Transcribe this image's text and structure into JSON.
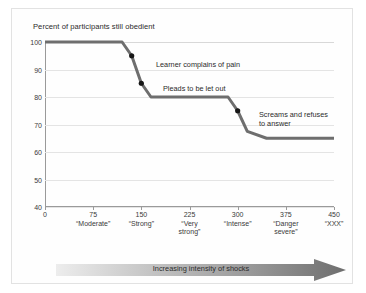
{
  "chart_data": {
    "type": "line",
    "title": "Percent of participants still obedient",
    "xlabel": "Increasing intensity of shocks",
    "ylabel": "Percent of participants still obedient",
    "xlim": [
      0,
      450
    ],
    "ylim": [
      40,
      100
    ],
    "grid": true,
    "legend": null,
    "y_ticks": [
      100,
      90,
      80,
      70,
      60,
      50,
      40
    ],
    "x_ticks": [
      {
        "value": 0,
        "volt": "0",
        "word": ""
      },
      {
        "value": 75,
        "volt": "75",
        "word": "“Moderate”"
      },
      {
        "value": 150,
        "volt": "150",
        "word": "“Strong”"
      },
      {
        "value": 225,
        "volt": "225",
        "word": "“Very\nstrong”"
      },
      {
        "value": 300,
        "volt": "300",
        "word": "“Intense”"
      },
      {
        "value": 375,
        "volt": "375",
        "word": "“Danger\nsevere”"
      },
      {
        "value": 450,
        "volt": "450",
        "word": "“XXX”"
      }
    ],
    "series": [
      {
        "name": "Percent still obedient",
        "color": "#6e6e6e",
        "points": [
          {
            "x": 0,
            "y": 100
          },
          {
            "x": 120,
            "y": 100
          },
          {
            "x": 135,
            "y": 95
          },
          {
            "x": 150,
            "y": 85
          },
          {
            "x": 165,
            "y": 80
          },
          {
            "x": 285,
            "y": 80
          },
          {
            "x": 300,
            "y": 75
          },
          {
            "x": 315,
            "y": 67.5
          },
          {
            "x": 345,
            "y": 65
          },
          {
            "x": 450,
            "y": 65
          }
        ]
      }
    ],
    "markers": [
      {
        "x": 135,
        "y": 95,
        "label": "Learner complains of pain"
      },
      {
        "x": 150,
        "y": 85,
        "label": "Pleads to be let out"
      },
      {
        "x": 300,
        "y": 75,
        "label": "Screams and refuses\nto answer"
      }
    ],
    "annotations": [
      {
        "id": "ann-pain",
        "text": "Learner complains of pain",
        "left": 144,
        "top": 51
      },
      {
        "id": "ann-pleads",
        "text": "Pleads to be let out",
        "left": 151,
        "top": 75
      },
      {
        "id": "ann-screams",
        "text": "Screams and refuses\nto answer",
        "left": 247,
        "top": 101
      }
    ],
    "colors": {
      "line": "#6e6e6e",
      "marker": "#161616",
      "grid": "#e4e4e4",
      "axis": "#9a9a9a",
      "arrow_start": "#e8e8e8",
      "arrow_end": "#6e6e6e",
      "text": "#2b2b2b"
    }
  }
}
